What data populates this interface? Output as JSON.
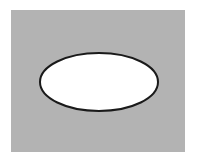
{
  "figure": {
    "width": 197,
    "height": 162,
    "background_color": "#ffffff",
    "panel": {
      "shape": "rectangle",
      "x": 11,
      "y": 10,
      "width": 174,
      "height": 142,
      "fill": "#b3b3b3"
    },
    "ellipse": {
      "shape": "ellipse",
      "cx": 99,
      "cy": 82,
      "rx": 59,
      "ry": 29,
      "fill": "#ffffff",
      "stroke": "#1a1a1a",
      "stroke_width": 2
    }
  }
}
